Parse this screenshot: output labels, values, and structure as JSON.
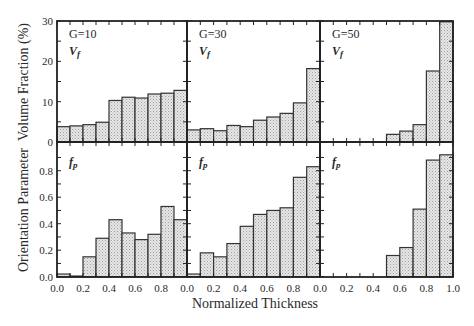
{
  "figure": {
    "xlabel": "Normalized Thickness",
    "ylabel_top": "Volume Fraction (%)",
    "ylabel_bottom": "Orientation Parameter"
  },
  "colors": {
    "bar_fill": "#e4e4e4",
    "stipple": "#9a9a9a",
    "axis": "#222222"
  },
  "chart_data": [
    {
      "type": "bar",
      "panel": "top-left",
      "title": "G=10",
      "label": "Vf",
      "categories": [
        "0.0-0.1",
        "0.1-0.2",
        "0.2-0.3",
        "0.3-0.4",
        "0.4-0.5",
        "0.5-0.6",
        "0.6-0.7",
        "0.7-0.8",
        "0.8-0.9",
        "0.9-1.0"
      ],
      "values": [
        3.8,
        4.0,
        4.3,
        4.9,
        10.3,
        11.1,
        10.9,
        11.9,
        12.1,
        12.8
      ],
      "xlabel": "Normalized Thickness",
      "ylabel": "Volume Fraction (%)",
      "ylim": [
        0,
        30
      ],
      "yticks": [
        0,
        10,
        20,
        30
      ],
      "xticks": [
        "0.0",
        "0.2",
        "0.4",
        "0.6",
        "0.8"
      ]
    },
    {
      "type": "bar",
      "panel": "top-middle",
      "title": "G=30",
      "label": "Vf",
      "categories": [
        "0.0-0.1",
        "0.1-0.2",
        "0.2-0.3",
        "0.3-0.4",
        "0.4-0.5",
        "0.5-0.6",
        "0.6-0.7",
        "0.7-0.8",
        "0.8-0.9",
        "0.9-1.0"
      ],
      "values": [
        3.0,
        3.3,
        2.8,
        4.1,
        3.8,
        5.4,
        6.2,
        7.1,
        9.7,
        18.2
      ],
      "xlabel": "Normalized Thickness",
      "ylabel": "Volume Fraction (%)",
      "ylim": [
        0,
        30
      ],
      "xticks": [
        "0.0",
        "0.2",
        "0.4",
        "0.6",
        "0.8"
      ]
    },
    {
      "type": "bar",
      "panel": "top-right",
      "title": "G=50",
      "label": "Vf",
      "categories": [
        "0.0-0.1",
        "0.1-0.2",
        "0.2-0.3",
        "0.3-0.4",
        "0.4-0.5",
        "0.5-0.6",
        "0.6-0.7",
        "0.7-0.8",
        "0.8-0.9",
        "0.9-1.0"
      ],
      "values": [
        0,
        0,
        0,
        0,
        0,
        1.9,
        2.7,
        4.3,
        17.6,
        29.8
      ],
      "xlabel": "Normalized Thickness",
      "ylabel": "Volume Fraction (%)",
      "ylim": [
        0,
        30
      ],
      "xticks": [
        "0.0",
        "0.2",
        "0.4",
        "0.6",
        "0.8",
        "1.0"
      ]
    },
    {
      "type": "bar",
      "panel": "bottom-left",
      "label": "fp",
      "categories": [
        "0.0-0.1",
        "0.1-0.2",
        "0.2-0.3",
        "0.3-0.4",
        "0.4-0.5",
        "0.5-0.6",
        "0.6-0.7",
        "0.7-0.8",
        "0.8-0.9",
        "0.9-1.0"
      ],
      "values": [
        0.02,
        0.005,
        0.15,
        0.29,
        0.43,
        0.33,
        0.28,
        0.32,
        0.53,
        0.43
      ],
      "xlabel": "Normalized Thickness",
      "ylabel": "Orientation Parameter",
      "ylim": [
        0,
        1.0
      ],
      "yticks": [
        0.0,
        0.2,
        0.4,
        0.6,
        0.8
      ],
      "xticks": [
        "0.0",
        "0.2",
        "0.4",
        "0.6",
        "0.8"
      ]
    },
    {
      "type": "bar",
      "panel": "bottom-middle",
      "label": "fp",
      "categories": [
        "0.0-0.1",
        "0.1-0.2",
        "0.2-0.3",
        "0.3-0.4",
        "0.4-0.5",
        "0.5-0.6",
        "0.6-0.7",
        "0.7-0.8",
        "0.8-0.9",
        "0.9-1.0"
      ],
      "values": [
        0.02,
        0.18,
        0.15,
        0.25,
        0.38,
        0.47,
        0.5,
        0.52,
        0.75,
        0.83
      ],
      "xlabel": "Normalized Thickness",
      "ylabel": "Orientation Parameter",
      "ylim": [
        0,
        1.0
      ],
      "xticks": [
        "0.0",
        "0.2",
        "0.4",
        "0.6",
        "0.8"
      ]
    },
    {
      "type": "bar",
      "panel": "bottom-right",
      "label": "fp",
      "categories": [
        "0.0-0.1",
        "0.1-0.2",
        "0.2-0.3",
        "0.3-0.4",
        "0.4-0.5",
        "0.5-0.6",
        "0.6-0.7",
        "0.7-0.8",
        "0.8-0.9",
        "0.9-1.0"
      ],
      "values": [
        0,
        0,
        0,
        0,
        0,
        0.16,
        0.22,
        0.51,
        0.88,
        0.92
      ],
      "xlabel": "Normalized Thickness",
      "ylabel": "Orientation Parameter",
      "ylim": [
        0,
        1.0
      ],
      "xticks": [
        "0.0",
        "0.2",
        "0.4",
        "0.6",
        "0.8",
        "1.0"
      ]
    }
  ]
}
